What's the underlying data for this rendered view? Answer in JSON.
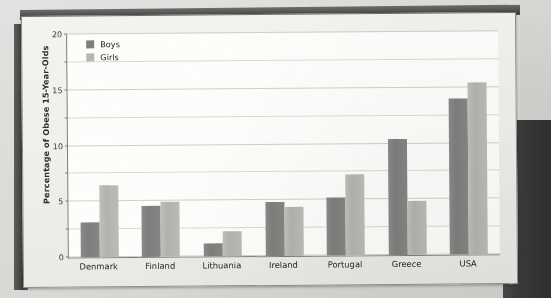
{
  "chart_data": {
    "type": "bar",
    "title": "",
    "xlabel": "",
    "ylabel": "Percentage of Obese 15-Year-Olds",
    "ylim": [
      0,
      20
    ],
    "yticks": [
      0,
      5,
      10,
      15,
      20
    ],
    "ytick_labels": [
      "0",
      "5",
      "10",
      "15",
      "20"
    ],
    "minor_gridline_step": 2.5,
    "grid": true,
    "legend_position": "top-left",
    "categories": [
      "Denmark",
      "Finland",
      "Lithuania",
      "Ireland",
      "Portugal",
      "Greece",
      "USA"
    ],
    "series": [
      {
        "name": "Boys",
        "color": "#7e7e7c",
        "values": [
          3.1,
          4.6,
          1.2,
          4.8,
          5.2,
          10.4,
          14.0
        ]
      },
      {
        "name": "Girls",
        "color": "#b6b6b3",
        "values": [
          6.5,
          4.9,
          2.2,
          4.4,
          7.3,
          4.8,
          15.4
        ]
      }
    ]
  },
  "colors": {
    "boys": "#7e7e7c",
    "girls": "#b6b6b3",
    "axis": "#7d7c79",
    "gridline": "#d9d9d5",
    "plot_background": "#fdfdfb",
    "page_background": "#dcdcda",
    "sheet_background": "#f2f1ee"
  }
}
